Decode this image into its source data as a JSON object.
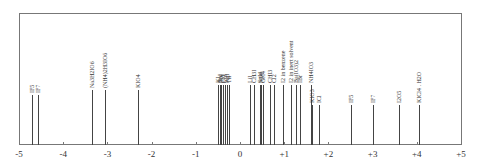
{
  "chart_data": {
    "type": "line",
    "title": "",
    "xlabel": "",
    "ylabel": "",
    "xlim": [
      -5,
      5
    ],
    "grid": false,
    "ticks": [
      "-5",
      "-4",
      "-3",
      "-2",
      "-1",
      "0",
      "+1",
      "+2",
      "+3",
      "+4",
      "+5"
    ],
    "tick_values": [
      -5,
      -4,
      -3,
      -2,
      -1,
      0,
      1,
      2,
      3,
      4,
      5
    ],
    "lines": [
      {
        "label": "IF5",
        "x": -4.7,
        "h": 50
      },
      {
        "label": "IF7",
        "x": -4.58,
        "h": 50
      },
      {
        "label": "Na3H2IO6",
        "x": -3.35,
        "h": 55
      },
      {
        "label": "(NH4)2H3IO6",
        "x": -3.05,
        "h": 55
      },
      {
        "label": "KIO4",
        "x": -2.3,
        "h": 55
      },
      {
        "label": "KI",
        "x": -0.5,
        "h": 60
      },
      {
        "label": "NaI",
        "x": -0.46,
        "h": 60
      },
      {
        "label": "RbI",
        "x": -0.42,
        "h": 60
      },
      {
        "label": "CsI",
        "x": -0.38,
        "h": 60
      },
      {
        "label": "CuI",
        "x": -0.34,
        "h": 60
      },
      {
        "label": "AgI",
        "x": -0.3,
        "h": 60
      },
      {
        "label": "TlI",
        "x": -0.26,
        "h": 60
      },
      {
        "label": "LiI",
        "x": 0.22,
        "h": 60
      },
      {
        "label": "CH3I",
        "x": 0.32,
        "h": 60
      },
      {
        "label": "SnI4",
        "x": 0.45,
        "h": 60
      },
      {
        "label": "SiI4",
        "x": 0.48,
        "h": 60
      },
      {
        "label": "GeI4",
        "x": 0.52,
        "h": 60
      },
      {
        "label": "CHI3",
        "x": 0.68,
        "h": 60
      },
      {
        "label": "Cl2",
        "x": 0.78,
        "h": 60
      },
      {
        "label": "I2 in benzene",
        "x": 0.98,
        "h": 60
      },
      {
        "label": "I2 in inert solvent",
        "x": 1.15,
        "h": 60
      },
      {
        "label": "Ba(IO3)2",
        "x": 1.27,
        "h": 60
      },
      {
        "label": "IBr",
        "x": 1.35,
        "h": 60
      },
      {
        "label": "NH4IO3",
        "x": 1.6,
        "h": 60
      },
      {
        "label": "KIO3",
        "x": 1.62,
        "h": 40
      },
      {
        "label": "ICl",
        "x": 1.78,
        "h": 40
      },
      {
        "label": "IF5",
        "x": 2.5,
        "h": 40
      },
      {
        "label": "IF7",
        "x": 3.0,
        "h": 40
      },
      {
        "label": "I2O5",
        "x": 3.6,
        "h": 40
      },
      {
        "label": "KICl4 . H2O",
        "x": 4.05,
        "h": 40
      }
    ]
  }
}
